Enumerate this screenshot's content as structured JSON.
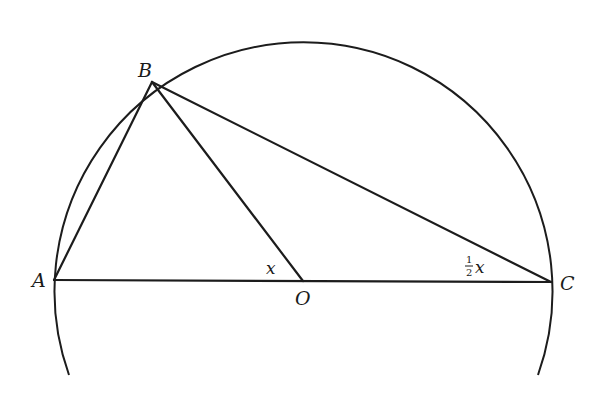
{
  "diagram": {
    "type": "geometry",
    "points": {
      "A": {
        "label": "A",
        "x": 54,
        "y": 280
      },
      "B": {
        "label": "B",
        "x": 152,
        "y": 82
      },
      "O": {
        "label": "O",
        "x": 303,
        "y": 281
      },
      "C": {
        "label": "C",
        "x": 551,
        "y": 282
      }
    },
    "circle": {
      "center": "O",
      "radius": 249
    },
    "segments": [
      [
        "A",
        "B"
      ],
      [
        "B",
        "O"
      ],
      [
        "B",
        "C"
      ],
      [
        "A",
        "C"
      ]
    ],
    "angles": {
      "BOA": {
        "label": "x"
      },
      "BCA": {
        "label_fraction_num": "1",
        "label_fraction_den": "2",
        "label_var": "x"
      }
    },
    "colors": {
      "stroke": "#1c1c1c",
      "background": "#ffffff"
    }
  }
}
